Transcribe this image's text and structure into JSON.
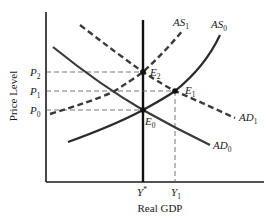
{
  "diagram": {
    "title": "",
    "type": "AD-AS model",
    "xlabel": "Real GDP",
    "ylabel": "Price Level",
    "x_ticks": [
      {
        "main": "Y",
        "sup": "*",
        "sub": ""
      },
      {
        "main": "Y",
        "sup": "",
        "sub": "1"
      }
    ],
    "y_ticks": [
      {
        "main": "P",
        "sub": "2"
      },
      {
        "main": "P",
        "sub": "1"
      },
      {
        "main": "P",
        "sub": "0"
      }
    ],
    "curves": [
      {
        "id": "AS1",
        "main": "AS",
        "sub": "1",
        "style": "dashed"
      },
      {
        "id": "AS0",
        "main": "AS",
        "sub": "0",
        "style": "solid"
      },
      {
        "id": "AD1",
        "main": "AD",
        "sub": "1",
        "style": "dashed"
      },
      {
        "id": "AD0",
        "main": "AD",
        "sub": "0",
        "style": "solid"
      }
    ],
    "points": [
      {
        "main": "E",
        "sub": "2"
      },
      {
        "main": "E",
        "sub": "1"
      },
      {
        "main": "E",
        "sub": "0"
      }
    ],
    "colors": {
      "line": "#1a1a1a",
      "curve": "#3a3a3a",
      "guide": "#555555"
    }
  }
}
